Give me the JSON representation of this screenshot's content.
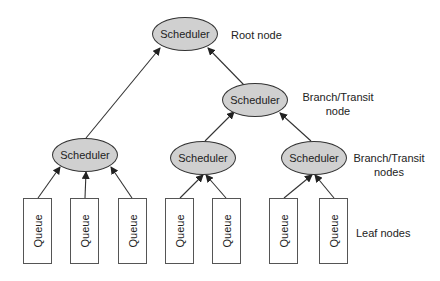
{
  "diagram": {
    "type": "scheduler-hierarchy-tree",
    "nodes": {
      "root": {
        "label": "Scheduler"
      },
      "branch": {
        "label": "Scheduler"
      },
      "left": {
        "label": "Scheduler"
      },
      "middle": {
        "label": "Scheduler"
      },
      "right": {
        "label": "Scheduler"
      }
    },
    "queues": [
      {
        "label": "Queue"
      },
      {
        "label": "Queue"
      },
      {
        "label": "Queue"
      },
      {
        "label": "Queue"
      },
      {
        "label": "Queue"
      },
      {
        "label": "Queue"
      },
      {
        "label": "Queue"
      }
    ],
    "annotations": {
      "root": "Root node",
      "branch_line1": "Branch/Transit",
      "branch_line2": "node",
      "branches_line1": "Branch/Transit",
      "branches_line2": "nodes",
      "leaf": "Leaf nodes"
    },
    "edges": [
      {
        "from": "left",
        "to": "root"
      },
      {
        "from": "branch",
        "to": "root"
      },
      {
        "from": "middle",
        "to": "branch"
      },
      {
        "from": "right",
        "to": "branch"
      },
      {
        "from": "queue-1",
        "to": "left"
      },
      {
        "from": "queue-2",
        "to": "left"
      },
      {
        "from": "queue-3",
        "to": "left"
      },
      {
        "from": "queue-4",
        "to": "middle"
      },
      {
        "from": "queue-5",
        "to": "middle"
      },
      {
        "from": "queue-6",
        "to": "right"
      },
      {
        "from": "queue-7",
        "to": "right"
      }
    ],
    "colors": {
      "node_fill": "#d0d0d0",
      "stroke": "#333333",
      "queue_fill": "#ffffff"
    }
  }
}
